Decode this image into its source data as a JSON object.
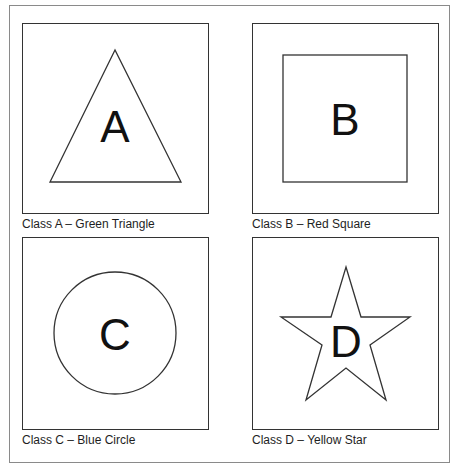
{
  "panels": [
    {
      "id": "A",
      "letter": "A",
      "caption": "Class A – Green Triangle",
      "shape": "triangle",
      "shape_icon": "triangle-icon"
    },
    {
      "id": "B",
      "letter": "B",
      "caption": "Class B – Red Square",
      "shape": "square",
      "shape_icon": "square-icon"
    },
    {
      "id": "C",
      "letter": "C",
      "caption": "Class C – Blue Circle",
      "shape": "circle",
      "shape_icon": "circle-icon"
    },
    {
      "id": "D",
      "letter": "D",
      "caption": "Class D – Yellow Star",
      "shape": "star",
      "shape_icon": "star-icon"
    }
  ],
  "colors": {
    "stroke": "#333333",
    "frame": "#8a8a8a",
    "text": "#1e1e1e"
  }
}
